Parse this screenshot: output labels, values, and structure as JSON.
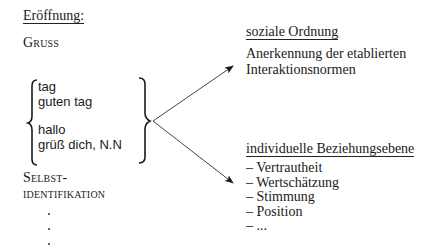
{
  "left": {
    "heading": "Eröffnung:",
    "gruss_label": "Gruss",
    "greetings": {
      "group1": [
        "tag",
        "guten tag"
      ],
      "group2": [
        "hallo",
        "grüß dich, N.N"
      ]
    },
    "selbst_label_line1": "Selbst-",
    "selbst_label_line2": "identifikation",
    "continuation_dots": [
      ".",
      ".",
      "."
    ]
  },
  "right": {
    "soziale": {
      "heading": "soziale Ordnung",
      "description_line1": "Anerkennung der etablierten",
      "description_line2": "Interaktionsnormen"
    },
    "individuell": {
      "heading": "individuelle Beziehungsebene",
      "items": [
        "– Vertrautheit",
        "– Wertschätzung",
        "– Stimmung",
        "– Position",
        "– ..."
      ]
    }
  },
  "connectors": {
    "brace_right_tip": [
      155,
      121
    ],
    "arrow_to_soziale": [
      233,
      66
    ],
    "arrow_to_individuell": [
      233,
      183
    ],
    "line_color": "#444444"
  }
}
